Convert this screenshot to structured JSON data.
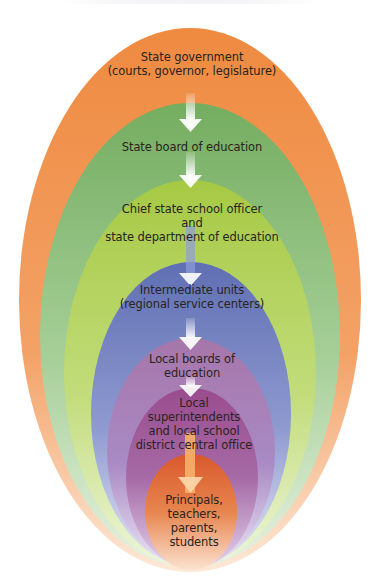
{
  "diagram": {
    "type": "nested-ellipses-hierarchy",
    "direction": "top-down",
    "levels": [
      {
        "id": "state-government",
        "lines": [
          "State government",
          "(courts, governor, legislature)"
        ],
        "color": "#f08a45"
      },
      {
        "id": "state-board",
        "lines": [
          "State board of education"
        ],
        "color": "#7fb26a"
      },
      {
        "id": "chief-state-school-officer",
        "lines": [
          "Chief state school officer",
          "and",
          "state department of education"
        ],
        "color": "#a8c84a"
      },
      {
        "id": "intermediate-units",
        "lines": [
          "Intermediate units",
          "(regional service centers)"
        ],
        "color": "#6a78b8"
      },
      {
        "id": "local-boards",
        "lines": [
          "Local boards of",
          "education"
        ],
        "color": "#a878a8"
      },
      {
        "id": "local-superintendents",
        "lines": [
          "Local",
          "superintendents",
          "and local school",
          "district central office"
        ],
        "color": "#9a5090"
      },
      {
        "id": "principals",
        "lines": [
          "Principals,",
          "teachers,",
          "parents,",
          "students"
        ],
        "color": "#e0683a"
      }
    ],
    "arrows": 6
  },
  "colors": {
    "orange": "#f08a45",
    "green": "#7fb26a",
    "yellow_green": "#a8c84a",
    "blue": "#6a78b8",
    "mauve": "#a878a8",
    "purple": "#9a5090",
    "inner_orange": "#e0683a",
    "text": "#2a2320"
  }
}
